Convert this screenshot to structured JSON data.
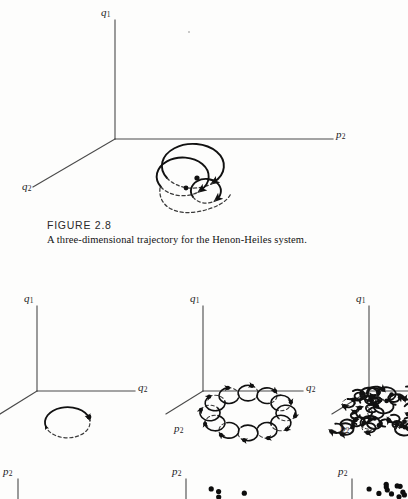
{
  "page": {
    "background_color": "#fdfdfc",
    "ink_color": "#111111",
    "axis_color": "#4a4a4a"
  },
  "figure": {
    "caption_title": "FIGURE 2.8",
    "caption_text": "A three-dimensional trajectory for the Henon-Heiles system.",
    "top_panel": {
      "name": "three-dimensional-trajectory",
      "axes": [
        {
          "id": "vertical",
          "label": "q",
          "subscript": "1"
        },
        {
          "id": "horizontal-right",
          "label": "p",
          "subscript": "2"
        },
        {
          "id": "diagonal-lower-left",
          "label": "q",
          "subscript": "2"
        }
      ],
      "description": "A single three-dimensional trajectory drawn as three nested spiral loops, solid in front and dashed where hidden behind, each loop ending in an arrowhead."
    },
    "bottom_panels": [
      {
        "name": "periodic-orbit-panel",
        "axes": [
          {
            "id": "vertical",
            "label": "q",
            "subscript": "1"
          },
          {
            "id": "horizontal-right",
            "label": "q",
            "subscript": "2"
          },
          {
            "id": "diagonal-lower-left",
            "label": "p",
            "subscript": "2"
          }
        ],
        "description": "A single closed elliptical periodic orbit, solid above and dashed below, with two arrowheads showing the direction of motion."
      },
      {
        "name": "quasiperiodic-torus-panel",
        "axes": [
          {
            "id": "vertical",
            "label": "q",
            "subscript": "1"
          },
          {
            "id": "horizontal-right",
            "label": "q",
            "subscript": "2"
          },
          {
            "id": "diagonal-lower-left",
            "label": "p",
            "subscript": "2"
          }
        ],
        "description": "A quasi-periodic trajectory winding as a chain of roughly twelve overlapping loops arranged around a ring, lying on an invariant torus."
      },
      {
        "name": "chaotic-trajectory-panel",
        "axes": [
          {
            "id": "vertical",
            "label": "q",
            "subscript": "1"
          },
          {
            "id": "horizontal-right",
            "label": "q",
            "subscript": "2"
          },
          {
            "id": "diagonal-lower-left",
            "label": "p",
            "subscript": "2"
          }
        ],
        "description": "A dense irregular tangle of many loops filling a volume, representing a chaotic trajectory. The panel is cropped at the right edge of the page."
      }
    ],
    "poincare_panels": [
      {
        "name": "poincare-section-periodic",
        "axis_label": "p",
        "axis_subscript": "2",
        "dot_count": 0
      },
      {
        "name": "poincare-section-quasiperiodic",
        "axis_label": "p",
        "axis_subscript": "2",
        "dot_count": 4
      },
      {
        "name": "poincare-section-chaotic",
        "axis_label": "p",
        "axis_subscript": "2",
        "dot_count": 11
      }
    ]
  },
  "chart_data": {
    "type": "line",
    "title": "A three-dimensional trajectory for the Henon-Heiles system.",
    "subtitle": "FIGURE 2.8",
    "grid": false,
    "legend": "none",
    "panels": [
      {
        "id": "top",
        "xlabel": "p2",
        "ylabel": "q1",
        "zlabel": "q2",
        "series": [
          {
            "name": "outer-loop",
            "kind": "spiral-arc",
            "radius": 30,
            "center": [
              196,
              170
            ],
            "visible_fraction": 0.72
          },
          {
            "name": "middle-loop",
            "kind": "spiral-arc",
            "radius": 24,
            "center": [
              190,
              180
            ],
            "visible_fraction": 0.72
          },
          {
            "name": "inner-loop",
            "kind": "spiral-arc",
            "radius": 14,
            "center": [
              207,
              191
            ],
            "visible_fraction": 0.72
          }
        ]
      },
      {
        "id": "bottom-left",
        "xlabel": "q2",
        "ylabel": "q1",
        "zlabel": "p2",
        "series": [
          {
            "name": "periodic-orbit",
            "kind": "ellipse",
            "center": [
              67,
              417
            ],
            "rx": 22,
            "ry": 15
          }
        ]
      },
      {
        "id": "bottom-middle",
        "xlabel": "q2",
        "ylabel": "q1",
        "zlabel": "p2",
        "series": [
          {
            "name": "quasiperiodic-torus",
            "kind": "loop-chain",
            "center": [
              248,
              413
            ],
            "ring_rx": 38,
            "ring_ry": 20,
            "loop_count": 12,
            "loop_radius": 10
          }
        ]
      },
      {
        "id": "bottom-right",
        "xlabel": "q2",
        "ylabel": "q1",
        "zlabel": "p2",
        "series": [
          {
            "name": "chaotic-tangle",
            "kind": "loop-cloud",
            "center": [
              378,
              412
            ],
            "spread_x": 42,
            "spread_y": 20,
            "loop_count": 34,
            "loop_radius": 8
          }
        ]
      }
    ]
  }
}
